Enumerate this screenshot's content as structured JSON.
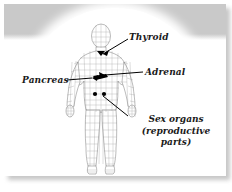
{
  "figure": {
    "kind": "anatomical-diagram",
    "background_color": "#ffffff",
    "band_color": "#c9c9c9",
    "line_color": "#555555",
    "marker_color": "#000000",
    "text_color": "#1a1a1a"
  },
  "labels": {
    "thyroid": "Thyroid",
    "adrenal": "Adrenal",
    "pancreas": "Pancreas",
    "sex_organs_line1": "Sex organs",
    "sex_organs_line2": "(reproductive",
    "sex_organs_line3": "parts)"
  }
}
